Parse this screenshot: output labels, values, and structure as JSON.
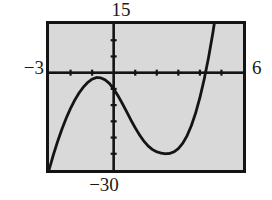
{
  "figure": {
    "kind": "graphing-calculator-viewing-window",
    "frame": {
      "background_color": "#d9d9d9",
      "border_color": "#141414"
    }
  },
  "labels": {
    "y_max": "15",
    "y_min": "−30",
    "x_min": "−3",
    "x_max": "6"
  },
  "chart_data": {
    "type": "line",
    "title": "",
    "subtitle": "",
    "xlabel": "",
    "ylabel": "",
    "xlim": [
      -3,
      6
    ],
    "ylim": [
      -30,
      15
    ],
    "grid": false,
    "legend": "none",
    "axis_color": "#141414",
    "curve_color": "#141414",
    "x_tick_step": 1,
    "y_tick_step": 5,
    "x_ticks": [
      -3,
      -2,
      -1,
      0,
      1,
      2,
      3,
      4,
      5,
      6
    ],
    "y_ticks": [
      -30,
      -25,
      -20,
      -15,
      -10,
      -5,
      0,
      5,
      10,
      15
    ],
    "tick_labels_shown": false,
    "window_labels": {
      "top": "15",
      "bottom": "−30",
      "left": "−3",
      "right": "6"
    },
    "series": [
      {
        "name": "cubic",
        "description": "cubic polynomial with local maximum near x=-1 touching y=0, local minimum near x=2.7 at about y=-25",
        "x": [
          -3.0,
          -2.8,
          -2.6,
          -2.4,
          -2.2,
          -2.0,
          -1.8,
          -1.6,
          -1.4,
          -1.2,
          -1.0,
          -0.8,
          -0.6,
          -0.4,
          -0.2,
          0.0,
          0.2,
          0.4,
          0.6,
          0.8,
          1.0,
          1.2,
          1.4,
          1.6,
          1.8,
          2.0,
          2.2,
          2.4,
          2.6,
          2.8,
          3.0,
          3.2,
          3.4,
          3.6,
          3.8,
          4.0,
          4.2,
          4.4,
          4.6,
          4.8,
          5.0,
          5.1
        ],
        "y": [
          -30.0,
          -25.4,
          -21.2,
          -17.4,
          -14.0,
          -11.0,
          -8.4,
          -6.2,
          -4.4,
          -3.0,
          -2.0,
          -1.5,
          -1.6,
          -2.2,
          -3.3,
          -5.0,
          -7.1,
          -9.5,
          -12.0,
          -14.6,
          -17.0,
          -19.2,
          -21.1,
          -22.6,
          -23.7,
          -24.4,
          -24.8,
          -25.0,
          -24.9,
          -24.4,
          -23.4,
          -21.8,
          -19.5,
          -16.4,
          -12.5,
          -7.7,
          -2.0,
          4.6,
          12.2,
          20.8,
          30.5,
          35.0
        ],
        "clip_to_window": true
      }
    ],
    "annotations": [
      {
        "type": "local_max",
        "x": -0.85,
        "y": -1.4
      },
      {
        "type": "local_min",
        "x": 2.45,
        "y": -25.0
      },
      {
        "type": "y_intercept",
        "x": 0,
        "y": -5
      },
      {
        "type": "x_intercept_right",
        "x": 4.2,
        "y": 0
      }
    ]
  }
}
